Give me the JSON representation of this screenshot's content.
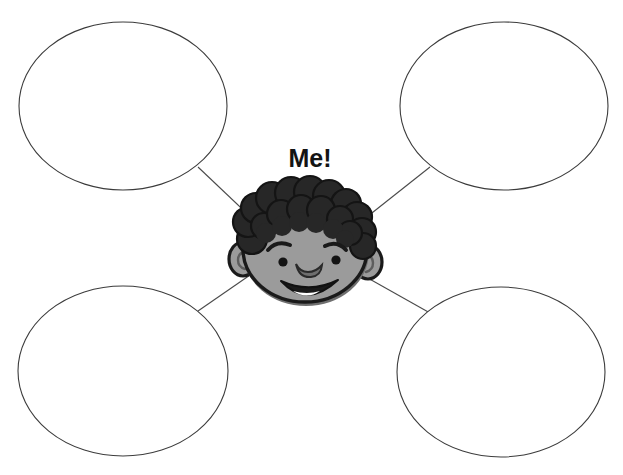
{
  "worksheet": {
    "title": "Me!",
    "center_label": "Me!",
    "background_color": "#ffffff",
    "line_color": "#4a4a4a",
    "outline_color": "#3c3c3c"
  },
  "character": {
    "name": "boy-face-illustration",
    "skin_color": "#9b9b9b",
    "skin_shadow_color": "#7f7f7f",
    "hair_color": "#272727",
    "outline_color": "#1a1a1a",
    "teeth_color": "#ffffff"
  },
  "bubbles": [
    {
      "id": "bubble-top-left",
      "position": "top-left",
      "text": "",
      "cx": 123,
      "cy": 106,
      "rx": 104,
      "ry": 84
    },
    {
      "id": "bubble-top-right",
      "position": "top-right",
      "text": "",
      "cx": 504,
      "cy": 106,
      "rx": 104,
      "ry": 84
    },
    {
      "id": "bubble-bottom-left",
      "position": "bottom-left",
      "text": "",
      "cx": 123,
      "cy": 371,
      "rx": 105,
      "ry": 85
    },
    {
      "id": "bubble-bottom-right",
      "position": "bottom-right",
      "text": "",
      "cx": 501,
      "cy": 372,
      "rx": 104,
      "ry": 85
    }
  ],
  "connectors": [
    {
      "id": "connector-top-left",
      "x1": 198,
      "y1": 167,
      "x2": 256,
      "y2": 222
    },
    {
      "id": "connector-top-right",
      "x1": 430,
      "y1": 167,
      "x2": 358,
      "y2": 224
    },
    {
      "id": "connector-bottom-left",
      "x1": 198,
      "y1": 311,
      "x2": 253,
      "y2": 273
    },
    {
      "id": "connector-bottom-right",
      "x1": 430,
      "y1": 313,
      "x2": 366,
      "y2": 277
    }
  ]
}
